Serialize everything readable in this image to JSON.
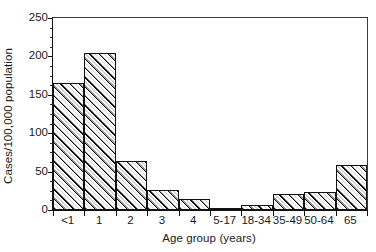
{
  "chart_data": {
    "type": "bar",
    "title": "",
    "xlabel": "Age group (years)",
    "ylabel": "Cases/100,000 population",
    "categories": [
      "<1",
      "1",
      "2",
      "3",
      "4",
      "5-17",
      "18-34",
      "35-49",
      "50-64",
      "65"
    ],
    "values": [
      166,
      204,
      64,
      26,
      14,
      2,
      7,
      21,
      24,
      59
    ],
    "ylim": [
      0,
      250
    ],
    "yticks": [
      0,
      50,
      100,
      150,
      200,
      250
    ],
    "ytick_labels": [
      "0",
      "50",
      "100",
      "150",
      "200",
      "250"
    ],
    "yminor_step": 12.5,
    "grid": false,
    "legend": null,
    "bar_style": "diagonal-hatch-black-outline"
  }
}
